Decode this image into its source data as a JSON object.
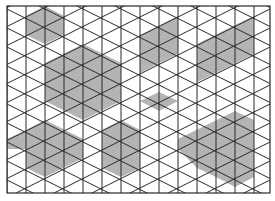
{
  "diagram": {
    "type": "isometric-triangle-grid",
    "frame": {
      "x": 7,
      "y": 6,
      "width": 263,
      "height": 187
    },
    "column_spacing": 19,
    "vertical_step": 19,
    "columns": 15,
    "colors": {
      "background": "#ffffff",
      "line": "#2a2a2a",
      "shade": "#b4b4b4"
    },
    "shaded_regions": [
      {
        "name": "top-left-hexagon",
        "points": [
          [
            26,
            16
          ],
          [
            45,
            6
          ],
          [
            64,
            16
          ],
          [
            64,
            35
          ],
          [
            45,
            44
          ],
          [
            26,
            35
          ]
        ]
      },
      {
        "name": "large-left-hexagon",
        "points": [
          [
            45,
            63
          ],
          [
            83,
            44
          ],
          [
            121,
            63
          ],
          [
            121,
            101
          ],
          [
            83,
            120
          ],
          [
            45,
            101
          ]
        ]
      },
      {
        "name": "top-middle-parallelogram",
        "points": [
          [
            140,
            35
          ],
          [
            178,
            16
          ],
          [
            178,
            54
          ],
          [
            140,
            73
          ]
        ]
      },
      {
        "name": "top-right-shape",
        "points": [
          [
            197,
            44
          ],
          [
            235,
            25
          ],
          [
            254,
            16
          ],
          [
            254,
            54
          ],
          [
            216,
            73
          ],
          [
            197,
            82
          ]
        ]
      },
      {
        "name": "middle-diamond",
        "points": [
          [
            140,
            101
          ],
          [
            159,
            92
          ],
          [
            178,
            101
          ],
          [
            159,
            111
          ]
        ]
      },
      {
        "name": "bottom-left-hexagon",
        "points": [
          [
            7,
            139
          ],
          [
            26,
            130
          ],
          [
            45,
            120
          ],
          [
            83,
            139
          ],
          [
            83,
            158
          ],
          [
            45,
            177
          ],
          [
            26,
            168
          ],
          [
            26,
            149
          ],
          [
            7,
            149
          ]
        ]
      },
      {
        "name": "bottom-middle-hexagon",
        "points": [
          [
            102,
            130
          ],
          [
            121,
            120
          ],
          [
            140,
            130
          ],
          [
            140,
            168
          ],
          [
            121,
            177
          ],
          [
            102,
            168
          ]
        ]
      },
      {
        "name": "bottom-right-shape",
        "points": [
          [
            178,
            139
          ],
          [
            235,
            111
          ],
          [
            254,
            120
          ],
          [
            254,
            177
          ],
          [
            235,
            187
          ],
          [
            216,
            177
          ],
          [
            197,
            168
          ],
          [
            178,
            149
          ]
        ]
      }
    ]
  }
}
